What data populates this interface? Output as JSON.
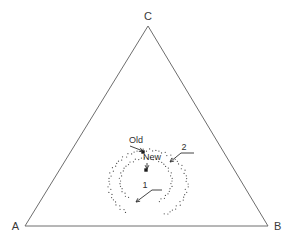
{
  "figure": {
    "type": "ternary-diagram",
    "background_color": "#ffffff",
    "line_color": "#6e6e6e",
    "text_color": "#303030",
    "width": 291,
    "height": 241
  },
  "vertices": {
    "a": {
      "label": "A",
      "x": 25,
      "y": 226
    },
    "b": {
      "label": "B",
      "x": 268,
      "y": 226
    },
    "c": {
      "label": "C",
      "x": 148,
      "y": 26
    }
  },
  "annotations": {
    "old": {
      "label": "Old",
      "x": 136,
      "y": 143
    },
    "new": {
      "label": "New",
      "x": 152,
      "y": 160
    },
    "contour_one": {
      "label": "1",
      "x": 145,
      "y": 188
    },
    "contour_two": {
      "label": "2",
      "x": 184,
      "y": 150
    }
  },
  "markers": [
    {
      "name": "old-point",
      "x": 143,
      "y": 152
    },
    {
      "name": "new-point",
      "x": 146,
      "y": 170
    }
  ],
  "chart_data": {
    "type": "scatter",
    "title": "",
    "xlabel": "",
    "ylabel": "",
    "axes": [
      "A",
      "B",
      "C"
    ],
    "series": [
      {
        "name": "1",
        "kind": "contour",
        "style": "dotted",
        "center": [
          146,
          181
        ],
        "rx": 26,
        "ry": 23,
        "gap_start_deg": 232,
        "gap_end_deg": 298,
        "points": 54
      },
      {
        "name": "2",
        "kind": "contour",
        "style": "dotted",
        "center": [
          148,
          184
        ],
        "rx": 39,
        "ry": 34,
        "gap_start_deg": 236,
        "gap_end_deg": 292,
        "points": 78
      }
    ],
    "points": [
      {
        "label": "Old",
        "x": 143,
        "y": 152
      },
      {
        "label": "New",
        "x": 146,
        "y": 170
      }
    ],
    "grid": false,
    "legend": "none"
  }
}
